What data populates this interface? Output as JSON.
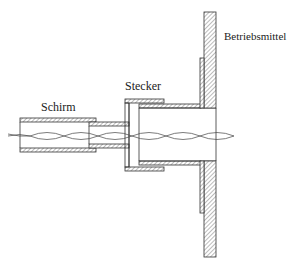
{
  "labels": {
    "shield": "Schirm",
    "connector": "Stecker",
    "equipment": "Betriebsmittel"
  },
  "colors": {
    "line": "#333333",
    "hatch": "#555555",
    "background": "#ffffff"
  }
}
